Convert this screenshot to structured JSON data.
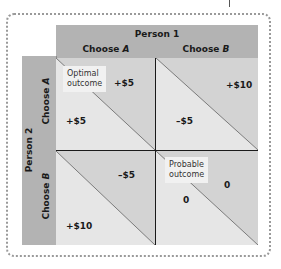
{
  "diagram": {
    "type": "payoff-matrix",
    "top_header": {
      "player": "Person 1",
      "columns": [
        {
          "prefix": "Choose ",
          "choice": "A"
        },
        {
          "prefix": "Choose ",
          "choice": "B"
        }
      ]
    },
    "side_header": {
      "player": "Person 2",
      "rows": [
        {
          "prefix": "Choose ",
          "choice": "A"
        },
        {
          "prefix": "Choose ",
          "choice": "B"
        }
      ]
    },
    "cells": [
      {
        "row": "A",
        "col": "A",
        "person1_payoff": "+$5",
        "person2_payoff": "+$5",
        "label": "Optimal\noutcome"
      },
      {
        "row": "A",
        "col": "B",
        "person1_payoff": "+$10",
        "person2_payoff": "–$5",
        "label": null
      },
      {
        "row": "B",
        "col": "A",
        "person1_payoff": "–$5",
        "person2_payoff": "+$10",
        "label": null
      },
      {
        "row": "B",
        "col": "B",
        "person1_payoff": "0",
        "person2_payoff": "0",
        "label": "Probable\noutcome"
      }
    ],
    "labels": {
      "optimal_line1": "Optimal",
      "optimal_line2": "outcome",
      "probable_line1": "Probable",
      "probable_line2": "outcome"
    },
    "colors": {
      "header": "#b3b3b3",
      "cell_light": "#e6e6e6",
      "cell_dark": "#d3d3d3",
      "label_box": "#f1f1f1",
      "frame": "#9a9a9a"
    }
  }
}
